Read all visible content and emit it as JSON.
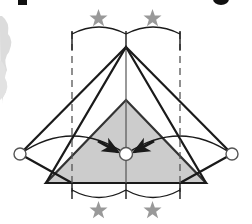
{
  "figure": {
    "canvas": {
      "width": 252,
      "height": 224
    },
    "background_color": "#ffffff",
    "stroke_color": "#1a1a1a",
    "shade_color": "#cccccc",
    "shade_stroke_color": "#555555",
    "star_color": "#999999",
    "dash_color": "#555555",
    "ink_smudge_color": "#d6d6d6",
    "cut_glyph_color": "#111111"
  },
  "geometry": {
    "outer_triangle": {
      "label": "outer-triangle",
      "apex": {
        "x": 126,
        "y": 47
      },
      "left_base": {
        "x": 46,
        "y": 183
      },
      "right_base": {
        "x": 206,
        "y": 183
      },
      "fill": "none"
    },
    "inner_triangle": {
      "label": "inner-shaded-triangle",
      "apex": {
        "x": 126,
        "y": 100
      },
      "left_base": {
        "x": 46,
        "y": 183
      },
      "right_base": {
        "x": 206,
        "y": 183
      },
      "fill": "#cccccc"
    },
    "left_flap": {
      "label": "left-folded-flap",
      "points": "20,154 72,183 46,183 20,154"
    },
    "right_flap": {
      "label": "right-folded-flap",
      "points": "232,154 180,183 206,183 232,154"
    },
    "center_axis": {
      "x": 126,
      "y_top": 47,
      "y_bottom": 183
    },
    "dashed_vertical_left": {
      "x": 72,
      "y_top": 32,
      "y_bottom": 192
    },
    "dashed_vertical_right": {
      "x": 180,
      "y_top": 32,
      "y_bottom": 192
    },
    "hinge_circles": [
      {
        "name": "left-hinge-circle",
        "x": 20,
        "y": 154,
        "r": 6
      },
      {
        "name": "center-hinge-circle",
        "x": 126,
        "y": 154,
        "r": 6
      },
      {
        "name": "right-hinge-circle",
        "x": 232,
        "y": 154,
        "r": 6
      }
    ],
    "fold_arcs": [
      {
        "name": "left-fold-arc",
        "path": "M 20 154 Q 72 120 126 154"
      },
      {
        "name": "right-fold-arc",
        "path": "M 232 154 Q 180 120 126 154"
      }
    ],
    "arrows": [
      {
        "name": "left-motion-arrow",
        "from": {
          "x": 100,
          "y": 142
        },
        "to": {
          "x": 120,
          "y": 153
        }
      },
      {
        "name": "right-motion-arrow",
        "from": {
          "x": 152,
          "y": 142
        },
        "to": {
          "x": 132,
          "y": 153
        }
      }
    ],
    "top_brace": {
      "name": "top-measurement-brace",
      "y": 35,
      "left_tick": {
        "x": 72,
        "y1": 32,
        "y2": 50
      },
      "center_tick": {
        "x": 126,
        "y1": 32,
        "y2": 50
      },
      "right_tick": {
        "x": 180,
        "y1": 32,
        "y2": 50
      },
      "arc_left": "M 72 35 Q 99 20 126 35",
      "arc_right": "M 126 35 Q 153 20 180 35"
    },
    "bottom_brace": {
      "name": "bottom-measurement-brace",
      "y": 190,
      "left_tick": {
        "x": 72,
        "y1": 184,
        "y2": 198
      },
      "center_tick": {
        "x": 126,
        "y1": 184,
        "y2": 198
      },
      "right_tick": {
        "x": 180,
        "y1": 184,
        "y2": 198
      },
      "arc_left": "M 72 190 Q 99 205 126 190",
      "arc_right": "M 126 190 Q 153 205 180 190"
    }
  },
  "annotations": {
    "stars": [
      {
        "name": "star-top-left",
        "x": 99,
        "y": 19,
        "size": 9,
        "position": "top-left"
      },
      {
        "name": "star-top-right",
        "x": 153,
        "y": 19,
        "size": 9,
        "position": "top-right"
      },
      {
        "name": "star-bottom-left",
        "x": 99,
        "y": 211,
        "size": 9,
        "position": "bottom-left"
      },
      {
        "name": "star-bottom-right",
        "x": 153,
        "y": 211,
        "size": 9,
        "position": "bottom-right"
      }
    ],
    "star_count": 4,
    "star_glyph": "star-icon"
  },
  "page_artifacts": {
    "cut_glyph_left": {
      "name": "cropped-text-glyph-left",
      "x": 18,
      "y": 0,
      "w": 9,
      "h": 6
    },
    "cut_glyph_right": {
      "name": "cropped-text-glyph-right",
      "x": 214,
      "y": 0,
      "w": 14,
      "h": 6
    },
    "ink_smudge": {
      "name": "scan-ink-smudge",
      "x": 0,
      "y": 14,
      "w": 14,
      "h": 90
    }
  }
}
